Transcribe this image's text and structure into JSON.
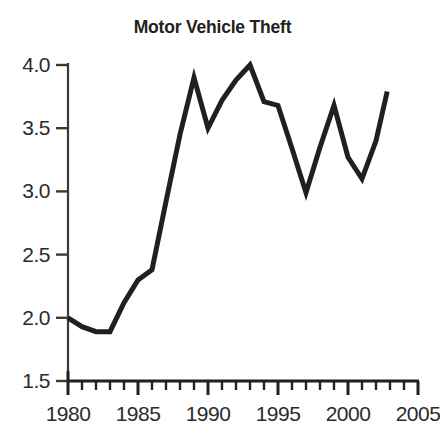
{
  "chart_data": {
    "type": "line",
    "title": "Motor Vehicle Theft",
    "xlabel": "",
    "ylabel": "",
    "xlim": [
      1980,
      2005
    ],
    "ylim": [
      1.5,
      4.0
    ],
    "grid": false,
    "legend": "none",
    "line_color": "#231f20",
    "x_major_ticks": [
      1980,
      1985,
      1990,
      1995,
      2000,
      2005
    ],
    "x_tick_labels": [
      "1980",
      "1985",
      "1990",
      "1995",
      "2000",
      "2005"
    ],
    "x_minor_tick_interval": 1,
    "y_ticks": [
      1.5,
      2.0,
      2.5,
      3.0,
      3.5,
      4.0
    ],
    "y_tick_labels": [
      "1.5",
      "2.0",
      "2.5",
      "3.0",
      "3.5",
      "4.0"
    ],
    "x": [
      1980,
      1981,
      1982,
      1983,
      1984,
      1985,
      1986,
      1987,
      1988,
      1989,
      1990,
      1991,
      1992,
      1993,
      1994,
      1995,
      1996,
      1997,
      1998,
      1999,
      2000,
      2001,
      2002
    ],
    "values": [
      2.0,
      1.93,
      1.89,
      1.89,
      2.12,
      2.3,
      2.38,
      2.92,
      3.45,
      3.9,
      3.5,
      3.72,
      3.88,
      4.0,
      3.71,
      3.68,
      3.34,
      2.99,
      3.35,
      3.68,
      3.27,
      3.1,
      3.4
    ],
    "series": [
      {
        "name": "Motor Vehicle Theft",
        "values": [
          2.0,
          1.93,
          1.89,
          1.89,
          2.12,
          2.3,
          2.38,
          2.92,
          3.45,
          3.9,
          3.5,
          3.72,
          3.88,
          4.0,
          3.71,
          3.68,
          3.34,
          2.99,
          3.35,
          3.68,
          3.27,
          3.1,
          3.4
        ]
      }
    ],
    "final_point": {
      "x": 2002.8,
      "y": 3.79
    }
  }
}
